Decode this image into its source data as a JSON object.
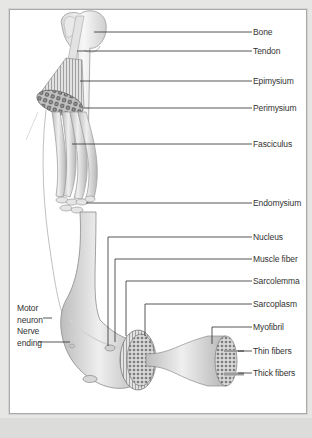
{
  "figure": {
    "colors": {
      "background": "#e6e6e4",
      "panel": "#ffffff",
      "panel_border": "#a9a9a9",
      "leader_line": "#2b2b2b",
      "tissue_light": "#ececec",
      "tissue_mid": "#c9c9c9",
      "tissue_dark": "#8a8a8a"
    }
  },
  "labels_right": [
    {
      "text": "Bone",
      "y": 32
    },
    {
      "text": "Tendon",
      "y": 51
    },
    {
      "text": "Epimysium",
      "y": 81
    },
    {
      "text": "Perimysium",
      "y": 108
    },
    {
      "text": "Fasciculus",
      "y": 144
    },
    {
      "text": "Endomysium",
      "y": 203
    },
    {
      "text": "Nucleus",
      "y": 237
    },
    {
      "text": "Muscle fiber",
      "y": 259
    },
    {
      "text": "Sarcolemma",
      "y": 281
    },
    {
      "text": "Sarcoplasm",
      "y": 304
    },
    {
      "text": "Myofibril",
      "y": 327
    },
    {
      "text": "Thin fibers",
      "y": 351
    },
    {
      "text": "Thick fibers",
      "y": 373
    }
  ],
  "labels_left": [
    {
      "line1": "Motor",
      "line2": "neuron"
    },
    {
      "line1": "Nerve",
      "line2": "ending"
    }
  ]
}
